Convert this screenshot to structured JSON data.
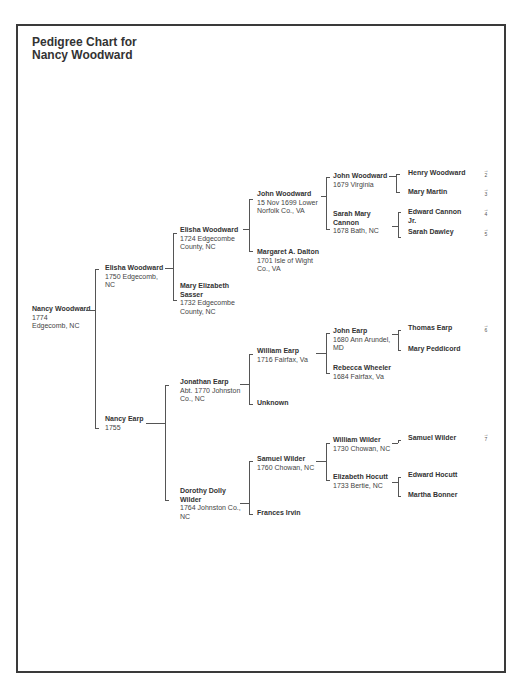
{
  "title_line1": "Pedigree Chart for",
  "title_line2": "Nancy Woodward",
  "people": {
    "p1": {
      "name": "Nancy Woodward",
      "info": "1774 Edgecomb, NC"
    },
    "p2": {
      "name": "Elisha Woodward",
      "info": "1750 Edgecomb, NC"
    },
    "p3": {
      "name": "Nancy Earp",
      "info": "1755"
    },
    "p4": {
      "name": "Elisha Woodward",
      "info": "1724 Edgecombe County, NC"
    },
    "p5": {
      "name": "Mary Elizabeth Sasser",
      "info": "1732 Edgecombe County, NC"
    },
    "p6": {
      "name": "Jonathan Earp",
      "info": "Abt. 1770 Johnston Co., NC"
    },
    "p7": {
      "name": "Dorothy Dolly Wilder",
      "info": "1764 Johnston Co., NC"
    },
    "p8": {
      "name": "John Woodward",
      "info": "15 Nov 1699 Lower Norfolk Co., VA"
    },
    "p9": {
      "name": "Margaret A. Dalton",
      "info": "1701 Isle of Wight Co., VA"
    },
    "p12": {
      "name": "William Earp",
      "info": "1716 Fairfax, Va"
    },
    "p13": {
      "name": "Unknown",
      "info": ""
    },
    "p14": {
      "name": "Samuel Wilder",
      "info": "1760 Chowan, NC"
    },
    "p15": {
      "name": "Frances Irvin",
      "info": ""
    },
    "p16": {
      "name": "John Woodward",
      "info": "1679 Virginia"
    },
    "p17": {
      "name": "Sarah Mary Cannon",
      "info": "1678 Bath, NC"
    },
    "p24": {
      "name": "John Earp",
      "info": "1680 Ann Arundel, MD"
    },
    "p25": {
      "name": "Rebecca Wheeler",
      "info": "1684 Fairfax, Va"
    },
    "p28": {
      "name": "William Wilder",
      "info": "1730 Chowan, NC"
    },
    "p29": {
      "name": "Elizabeth Hocutt",
      "info": "1733 Bertie, NC"
    },
    "p32": {
      "name": "Henry Woodward",
      "info": ""
    },
    "p33": {
      "name": "Mary Martin",
      "info": ""
    },
    "p34": {
      "name": "Edward Cannon Jr.",
      "info": ""
    },
    "p35": {
      "name": "Sarah Dawley",
      "info": ""
    },
    "p48": {
      "name": "Thomas Earp",
      "info": ""
    },
    "p49": {
      "name": "Mary Peddicord",
      "info": ""
    },
    "p56": {
      "name": "Samuel Wilder",
      "info": ""
    },
    "p58": {
      "name": "Edward Hocutt",
      "info": ""
    },
    "p59": {
      "name": "Martha Bonner",
      "info": ""
    }
  },
  "continuation_refs": {
    "r1": {
      "arrow": "→",
      "num": "2"
    },
    "r2": {
      "arrow": "→",
      "num": "3"
    },
    "r3": {
      "arrow": "→",
      "num": "4"
    },
    "r4": {
      "arrow": "→",
      "num": "5"
    },
    "r5": {
      "arrow": "→",
      "num": "6"
    },
    "r6": {
      "arrow": "→",
      "num": "7"
    }
  }
}
